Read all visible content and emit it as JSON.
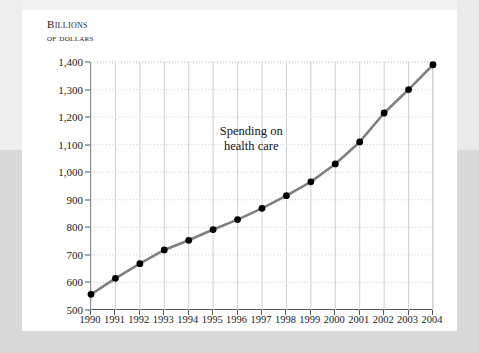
{
  "figure": {
    "unit_caption_line1": "Billions",
    "unit_caption_line2": "of dollars",
    "annotation_line1": "Spending on",
    "annotation_line2": "health care",
    "line_color": "#808080",
    "marker_color": "#000000",
    "grid_color": "#cfcfcf",
    "axis_color": "#555555"
  },
  "chart_data": {
    "type": "line",
    "title": "",
    "subtitle": "",
    "xlabel": "",
    "ylabel": "Billions of dollars",
    "categories": [
      "1990",
      "1991",
      "1992",
      "1993",
      "1994",
      "1995",
      "1996",
      "1997",
      "1998",
      "1999",
      "2000",
      "2001",
      "2002",
      "2003",
      "2004"
    ],
    "x": [
      1990,
      1991,
      1992,
      1993,
      1994,
      1995,
      1996,
      1997,
      1998,
      1999,
      2000,
      2001,
      2002,
      2003,
      2004
    ],
    "values": [
      557,
      615,
      668,
      718,
      753,
      792,
      828,
      869,
      915,
      965,
      1030,
      1110,
      1215,
      1300,
      1390
    ],
    "series": [
      {
        "name": "Spending on health care",
        "values": [
          557,
          615,
          668,
          718,
          753,
          792,
          828,
          869,
          915,
          965,
          1030,
          1110,
          1215,
          1300,
          1390
        ]
      }
    ],
    "ylim": [
      500,
      1400
    ],
    "yticks": [
      500,
      600,
      700,
      800,
      900,
      1000,
      1100,
      1200,
      1300,
      1400
    ],
    "ytick_labels": [
      "500",
      "600",
      "700",
      "800",
      "900",
      "1,000",
      "1,100",
      "1,200",
      "1,300",
      "1,400"
    ],
    "xlim": [
      1990,
      2004
    ],
    "grid": true,
    "grid_horizontal": "dotted",
    "grid_vertical": "solid-light",
    "legend": false,
    "legend_position": "none",
    "annotations": [
      {
        "text": "Spending on health care",
        "x": 1996.6,
        "y": 1120
      }
    ]
  }
}
